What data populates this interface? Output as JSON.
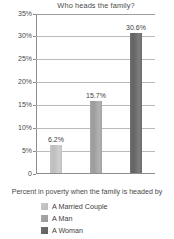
{
  "chart_data": {
    "type": "bar",
    "title": "Who heads the family?",
    "xlabel": "Percent in poverty when the family is headed by",
    "ylabel": "",
    "categories": [
      "A Married Couple",
      "A Man",
      "A Woman"
    ],
    "values": [
      6.2,
      15.7,
      30.6
    ],
    "data_labels": [
      "6.2%",
      "15.7%",
      "30.6%"
    ],
    "ylim": [
      0,
      35
    ],
    "ytick_values": [
      0,
      5,
      10,
      15,
      20,
      25,
      30,
      35
    ],
    "ytick_labels": [
      "0",
      "5%",
      "10%",
      "15%",
      "20%",
      "25%",
      "30%",
      "35%"
    ],
    "grid": true,
    "legend_position": "bottom-left",
    "series_colors": [
      "#c4c4c4",
      "#a2a2a2",
      "#696969"
    ],
    "legend": [
      {
        "label": "A Married Couple",
        "color": "#c4c4c4"
      },
      {
        "label": "A Man",
        "color": "#a2a2a2"
      },
      {
        "label": "A Woman",
        "color": "#696969"
      }
    ]
  }
}
